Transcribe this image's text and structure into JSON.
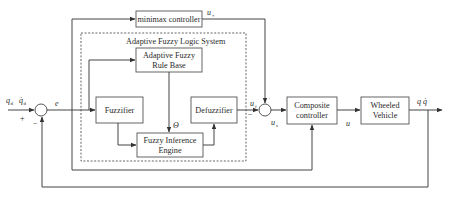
{
  "diagram": {
    "title": "Adaptive Fuzzy Logic System",
    "blocks": {
      "minimax": "minimax controller",
      "rule_base_line1": "Adaptive Fuzzy",
      "rule_base_line2": "Rule Base",
      "fuzzifier": "Fuzzifier",
      "defuzzifier": "Defuzzifier",
      "inference_line1": "Fuzzy Inference",
      "inference_line2": "Engine",
      "composite_line1": "Composite",
      "composite_line2": "controller",
      "vehicle_line1": "Wheeled",
      "vehicle_line2": "Vehicle"
    },
    "signals": {
      "input": "q",
      "input_sub": "d",
      "input_dot": "q̇",
      "input_dot_sub": "d",
      "error": "e",
      "plus": "+",
      "minus": "−",
      "theta": "Θ",
      "u_star": "u",
      "u_star_sub": "*",
      "u_f": "u",
      "u_f_sub": "f",
      "u_s": "u",
      "u_s_sub": "s",
      "junction2_top_sign": "+",
      "junction2_left_sign": "−",
      "u": "u",
      "output": "q  q̇"
    }
  }
}
